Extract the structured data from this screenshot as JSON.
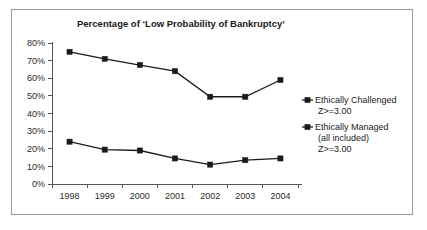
{
  "chart_data": {
    "type": "line",
    "title": "Percentage of ‘Low Probability of Bankruptcy’",
    "xlabel": "",
    "ylabel": "",
    "categories": [
      "1998",
      "1999",
      "2000",
      "2001",
      "2002",
      "2003",
      "2004"
    ],
    "ylim": [
      0,
      80
    ],
    "ytick_values": [
      0,
      10,
      20,
      30,
      40,
      50,
      60,
      70,
      80
    ],
    "ytick_labels": [
      "0%",
      "10%",
      "20%",
      "30%",
      "40%",
      "50%",
      "60%",
      "70%",
      "80%"
    ],
    "grid": false,
    "legend_position": "right",
    "series": [
      {
        "name": "Ethically Challenged Z>=3.00",
        "legend_line1": "Ethically Challenged",
        "legend_line2": "Z>=3.00",
        "legend_line3": "",
        "marker": "square",
        "color": "#1a1a1a",
        "values": [
          75,
          71,
          67.5,
          64,
          49.5,
          49.5,
          59
        ]
      },
      {
        "name": "Ethically Managed (all included) Z>=3.00",
        "legend_line1": "Ethically Managed",
        "legend_line2": "(all included)",
        "legend_line3": "Z>=3.00",
        "marker": "square",
        "color": "#1a1a1a",
        "values": [
          24,
          19.5,
          19,
          14.5,
          11,
          13.5,
          14.5
        ]
      }
    ]
  },
  "figure": {
    "border_color": "#9a9a9a",
    "background": "#ffffff",
    "axis_color": "#555555"
  }
}
